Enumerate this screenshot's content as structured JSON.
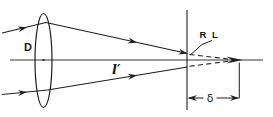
{
  "figure": {
    "labels": {
      "lens_diameter": "D",
      "image_distance": "l′",
      "blur_point": "R L",
      "defocus_distance": "δ"
    },
    "colors": {
      "ink": "#1f1f1f",
      "background": "#ffffff"
    }
  }
}
